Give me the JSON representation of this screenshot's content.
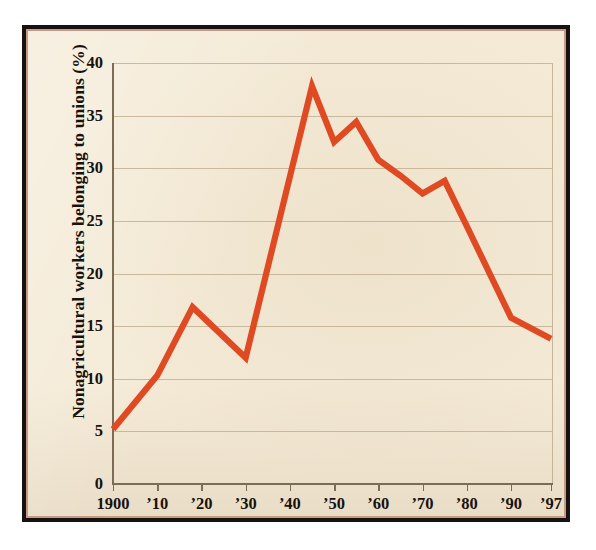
{
  "chart_data": {
    "type": "line",
    "title": "",
    "xlabel": "",
    "ylabel": "Nonagricultural workers belonging to unions (%)",
    "xlim": [
      1900,
      1997
    ],
    "ylim": [
      0,
      40
    ],
    "grid": true,
    "legend": "none",
    "line_color": "#e04a22",
    "background_color": "#f4ead6",
    "frame_color": "#17120f",
    "gridline_color": "#c2b093",
    "ytick_values": [
      0,
      5,
      10,
      15,
      20,
      25,
      30,
      35,
      40
    ],
    "ytick_labels": [
      "0",
      "5",
      "10",
      "15",
      "20",
      "25",
      "30",
      "35",
      "40"
    ],
    "xtick_values": [
      1900,
      1910,
      1920,
      1930,
      1940,
      1950,
      1960,
      1970,
      1980,
      1990,
      1997
    ],
    "xtick_labels": [
      "1900",
      "’10",
      "’20",
      "’30",
      "’40",
      "’50",
      "’60",
      "’70",
      "’80",
      "’90",
      "’97"
    ],
    "x": [
      1900,
      1910,
      1918,
      1930,
      1945,
      1950,
      1955,
      1960,
      1965,
      1970,
      1975,
      1980,
      1990,
      1997
    ],
    "values": [
      5.2,
      10.3,
      16.8,
      12.0,
      37.8,
      32.5,
      34.4,
      30.8,
      29.3,
      27.6,
      28.8,
      24.5,
      15.8,
      13.8
    ],
    "series": [
      {
        "name": "Nonagricultural workers belonging to unions (%)",
        "color": "#e04a22",
        "points": [
          {
            "x": 1900,
            "y": 5.2
          },
          {
            "x": 1910,
            "y": 10.3
          },
          {
            "x": 1918,
            "y": 16.8
          },
          {
            "x": 1930,
            "y": 12.0
          },
          {
            "x": 1945,
            "y": 37.8
          },
          {
            "x": 1950,
            "y": 32.5
          },
          {
            "x": 1955,
            "y": 34.4
          },
          {
            "x": 1960,
            "y": 30.8
          },
          {
            "x": 1965,
            "y": 29.3
          },
          {
            "x": 1970,
            "y": 27.6
          },
          {
            "x": 1975,
            "y": 28.8
          },
          {
            "x": 1980,
            "y": 24.5
          },
          {
            "x": 1990,
            "y": 15.8
          },
          {
            "x": 1997,
            "y": 13.8
          }
        ]
      }
    ]
  }
}
